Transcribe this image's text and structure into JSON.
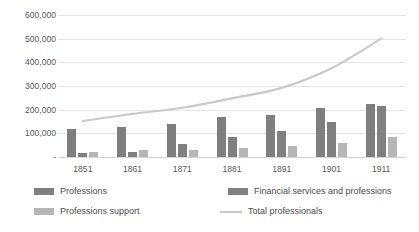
{
  "chart_data": {
    "type": "bar",
    "title": "",
    "subtitle": "",
    "xlabel": "",
    "ylabel": "",
    "categories": [
      "1851",
      "1861",
      "1871",
      "1881",
      "1891",
      "1901",
      "1911"
    ],
    "ylim": [
      0,
      600000
    ],
    "ytick_values": [
      600000,
      500000,
      400000,
      300000,
      200000,
      100000,
      0
    ],
    "ytick_labels": [
      "600,000",
      "500,000",
      "400,000",
      "300,000",
      "200,000",
      "100,000",
      "-"
    ],
    "grid": true,
    "legend_position": "bottom",
    "series": [
      {
        "name": "Professions",
        "kind": "bar",
        "color": "#7f7f7f",
        "values": [
          118000,
          128000,
          138000,
          168000,
          178000,
          205000,
          225000
        ]
      },
      {
        "name": "Financial services and professions",
        "kind": "bar",
        "color": "#808080",
        "values": [
          18000,
          22000,
          55000,
          85000,
          112000,
          150000,
          215000
        ]
      },
      {
        "name": "Professions support",
        "kind": "bar",
        "color": "#b6b6b6",
        "values": [
          22000,
          28000,
          30000,
          38000,
          48000,
          58000,
          85000
        ]
      },
      {
        "name": "Total professionals",
        "kind": "line",
        "color": "#c9c9c9",
        "values": [
          152000,
          182000,
          208000,
          248000,
          292000,
          375000,
          500000
        ]
      }
    ]
  }
}
